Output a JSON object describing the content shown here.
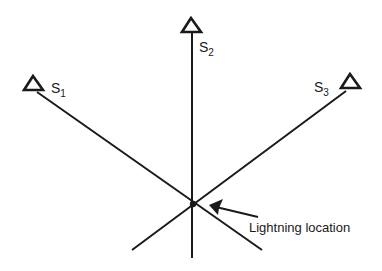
{
  "diagram": {
    "stations": [
      {
        "id": "S1",
        "letter": "S",
        "sub": "1",
        "x": 33,
        "y": 84
      },
      {
        "id": "S2",
        "letter": "S",
        "sub": "2",
        "x": 192,
        "y": 26
      },
      {
        "id": "S3",
        "letter": "S",
        "sub": "3",
        "x": 350,
        "y": 82
      }
    ],
    "intersection": {
      "x": 193,
      "y": 204
    },
    "annotation": {
      "text": "Lightning location"
    },
    "colors": {
      "line": "#1a1a1a",
      "background": "#ffffff"
    }
  }
}
